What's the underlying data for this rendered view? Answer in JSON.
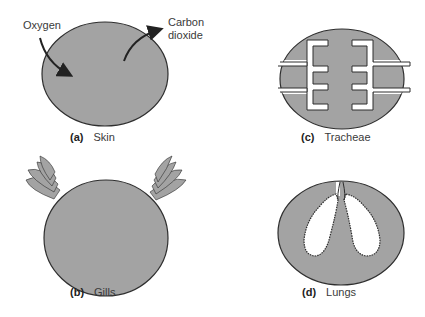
{
  "colors": {
    "tissue_fill": "#a3a3a3",
    "outline": "#2e2e2e",
    "airway": "#ffffff",
    "text": "#3a3a3a"
  },
  "panels": [
    {
      "id": "a",
      "letter": "(a)",
      "name": "Skin",
      "annotations": [
        "Oxygen",
        "Carbon\ndioxide"
      ]
    },
    {
      "id": "b",
      "letter": "(b)",
      "name": "Gills"
    },
    {
      "id": "c",
      "letter": "(c)",
      "name": "Tracheae"
    },
    {
      "id": "d",
      "letter": "(d)",
      "name": "Lungs"
    }
  ],
  "skin": {
    "oxygen_label": "Oxygen",
    "co2_label_line1": "Carbon",
    "co2_label_line2": "dioxide"
  }
}
